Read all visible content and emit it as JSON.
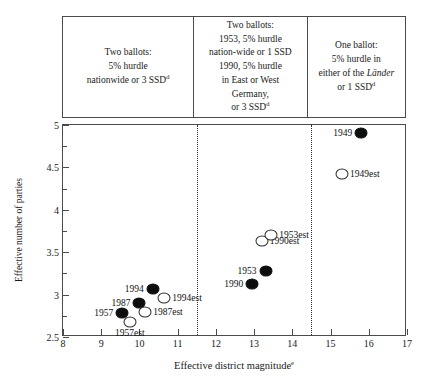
{
  "chart_data": {
    "type": "scatter",
    "title": "",
    "xlabel": "Effective district magnitude",
    "xlabel_superscript": "e",
    "ylabel": "Effective number of parties",
    "xlim": [
      8,
      17
    ],
    "ylim": [
      2.5,
      5
    ],
    "x_ticks": [
      8,
      9,
      10,
      11,
      12,
      13,
      14,
      15,
      16,
      17
    ],
    "y_ticks": [
      2.5,
      3,
      3.5,
      4,
      4.5,
      5
    ],
    "y_minor_ticks": [
      2.75,
      3.25,
      3.75,
      4.25,
      4.75
    ],
    "grid": false,
    "legend": "none",
    "dividers": [
      11.5,
      14.5
    ],
    "series": [
      {
        "name": "Actual",
        "marker": "filled-circle",
        "points": [
          {
            "label": "1957",
            "x": 9.55,
            "y": 2.78,
            "label_pos": "left"
          },
          {
            "label": "1987",
            "x": 10.0,
            "y": 2.9,
            "label_pos": "left"
          },
          {
            "label": "1994",
            "x": 10.35,
            "y": 3.07,
            "label_pos": "left"
          },
          {
            "label": "1990",
            "x": 12.95,
            "y": 3.13,
            "label_pos": "left"
          },
          {
            "label": "1953",
            "x": 13.3,
            "y": 3.28,
            "label_pos": "left"
          },
          {
            "label": "1949",
            "x": 15.8,
            "y": 4.9,
            "label_pos": "left"
          }
        ]
      },
      {
        "name": "Estimated",
        "marker": "open-circle",
        "points": [
          {
            "label": "1957est",
            "x": 9.75,
            "y": 2.68,
            "label_pos": "below"
          },
          {
            "label": "1987est",
            "x": 10.15,
            "y": 2.8,
            "label_pos": "right"
          },
          {
            "label": "1994est",
            "x": 10.65,
            "y": 2.96,
            "label_pos": "right"
          },
          {
            "label": "1990est",
            "x": 13.2,
            "y": 3.63,
            "label_pos": "right"
          },
          {
            "label": "1953est",
            "x": 13.45,
            "y": 3.7,
            "label_pos": "right"
          },
          {
            "label": "1949est",
            "x": 15.3,
            "y": 4.42,
            "label_pos": "right"
          }
        ]
      }
    ]
  },
  "regimes": [
    {
      "id": "two-ballots-nationwide",
      "lines": [
        {
          "text": "Two ballots:"
        },
        {
          "text": "5%  hurdle"
        },
        {
          "text": "nationwide or 3 SSD",
          "sup": "d"
        }
      ]
    },
    {
      "id": "two-ballots-1953-1990",
      "lines": [
        {
          "text": "Two ballots:"
        },
        {
          "text": "1953, 5% hurdle"
        },
        {
          "text": "nation-wide or 1 SSD"
        },
        {
          "text": "1990, 5% hurdle"
        },
        {
          "text": "in East or West"
        },
        {
          "text": "Germany,"
        },
        {
          "text": "or 3 SSD",
          "sup": "d"
        }
      ]
    },
    {
      "id": "one-ballot",
      "lines": [
        {
          "text": "One ballot:"
        },
        {
          "text": "5% hurdle in"
        },
        {
          "text": "either of the ",
          "italic_tail": "Länder"
        },
        {
          "text": "or 1 SSD",
          "sup": "d"
        }
      ]
    }
  ]
}
